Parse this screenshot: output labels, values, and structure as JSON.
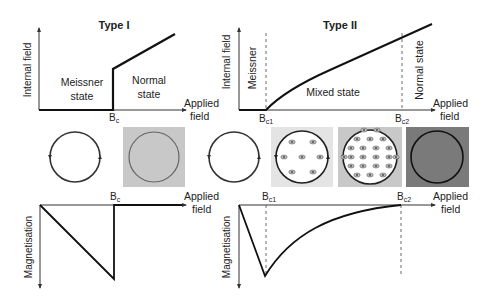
{
  "type1": {
    "title": "Type I",
    "top": {
      "ylabel": "Internal field",
      "xlabel_line1": "Applied",
      "xlabel_line2": "field",
      "region_left_line1": "Meissner",
      "region_left_line2": "state",
      "region_right_line1": "Normal",
      "region_right_line2": "state",
      "critical_label": "B",
      "critical_sub": "c"
    },
    "bottom": {
      "ylabel": "Magnetisation",
      "xlabel_line1": "Applied",
      "xlabel_line2": "field",
      "critical_label": "B",
      "critical_sub": "c"
    },
    "panels": [
      {
        "state": "meissner",
        "fill": "#ffffff",
        "circle_fill": "#ffffff",
        "vortices": 0
      },
      {
        "state": "normal",
        "fill": "#c8c8c8",
        "circle_fill": "#c8c8c8",
        "vortices": 0
      }
    ]
  },
  "type2": {
    "title": "Type II",
    "top": {
      "ylabel": "Internal field",
      "xlabel_line1": "Applied",
      "xlabel_line2": "field",
      "region_meissner": "Meissner",
      "region_mixed": "Mixed state",
      "region_normal": "Normal state",
      "critical1_label": "B",
      "critical1_sub": "c1",
      "critical2_label": "B",
      "critical2_sub": "c2"
    },
    "bottom": {
      "ylabel": "Magnetisation",
      "xlabel_line1": "Applied",
      "xlabel_line2": "field",
      "critical1_label": "B",
      "critical1_sub": "c1",
      "critical2_label": "B",
      "critical2_sub": "c2"
    },
    "panels": [
      {
        "state": "meissner",
        "fill": "#ffffff",
        "circle_fill": "#ffffff",
        "vortices": 0
      },
      {
        "state": "mixed-low",
        "fill": "#e4e4e4",
        "circle_fill": "#ffffff",
        "vortices": 7
      },
      {
        "state": "mixed-high",
        "fill": "#c8c8c8",
        "circle_fill": "#ffffff",
        "vortices": 22
      },
      {
        "state": "normal",
        "fill": "#7a7a7a",
        "circle_fill": "#7a7a7a",
        "vortices": 0
      }
    ]
  },
  "colors": {
    "line": "#1a1a1a",
    "axis": "#333333",
    "light_gray": "#e4e4e4",
    "mid_gray": "#c8c8c8",
    "dark_gray": "#7a7a7a"
  }
}
